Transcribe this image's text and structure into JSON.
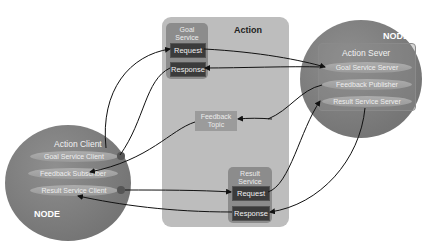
{
  "action": {
    "title": "Action"
  },
  "goal_service": {
    "title_line1": "Goal",
    "title_line2": "Service",
    "request": "Request",
    "response": "Response"
  },
  "result_service": {
    "title_line1": "Result",
    "title_line2": "Service",
    "request": "Request",
    "response": "Response"
  },
  "feedback_topic": {
    "line1": "Feedback",
    "line2": "Topic"
  },
  "client_node": {
    "node_label": "NODE",
    "title": "Action Client",
    "items": [
      "Goal Service Client",
      "Feedback Subscriber",
      "Result Service Client"
    ]
  },
  "server_node": {
    "node_label": "NODE",
    "title": "Action Sever",
    "items": [
      "Goal Service Server",
      "Feedback Publisher",
      "Result Service Server"
    ]
  },
  "colors": {
    "node": "#7a7a7a",
    "action_bg": "#bdbdbd",
    "service_bg": "#8c8c8c",
    "button": "#3b3b3b",
    "wire": "#111111"
  }
}
